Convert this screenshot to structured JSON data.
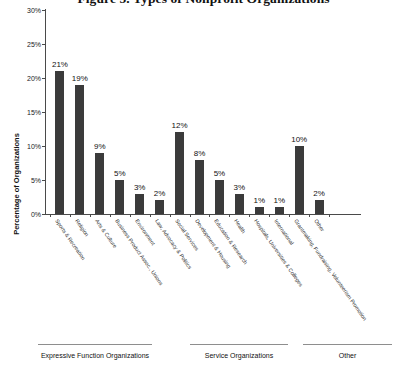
{
  "chart_data": {
    "type": "bar",
    "title": "Figure 5. Types of Nonprofit Organizations",
    "xlabel": "",
    "ylabel": "Percentage of Organizations",
    "ylim": [
      0,
      30
    ],
    "yticks": [
      "0%",
      "5%",
      "10%",
      "15%",
      "20%",
      "25%",
      "30%"
    ],
    "ytick_values": [
      0,
      5,
      10,
      15,
      20,
      25,
      30
    ],
    "grid": false,
    "legend": null,
    "value_suffix": "%",
    "categories": [
      "Sports & Recreation",
      "Religion",
      "Arts & Culture",
      "Business Product Assoc., Unions",
      "Environment",
      "Law, Advocacy & Politics",
      "Social Services",
      "Development & Housing",
      "Education & Research",
      "Health",
      "Hospitals, Universities & Colleges",
      "International",
      "Grantmaking, Fundraising, Volunteerism Promotion",
      "Other"
    ],
    "values": [
      21,
      19,
      9,
      5,
      3,
      2,
      12,
      8,
      5,
      3,
      1,
      1,
      10,
      2
    ],
    "value_labels": [
      "21%",
      "19%",
      "9%",
      "5%",
      "3%",
      "2%",
      "12%",
      "8%",
      "5%",
      "3%",
      "1%",
      "1%",
      "10%",
      "2%"
    ],
    "bar_color": "#3b3b3b",
    "axis_color": "#4a4a4a",
    "groups": [
      {
        "label": "Expressive Function Organizations",
        "start_index": 0,
        "end_index": 5
      },
      {
        "label": "Service Organizations",
        "start_index": 6,
        "end_index": 11
      },
      {
        "label": "Other",
        "start_index": 12,
        "end_index": 13
      }
    ]
  }
}
